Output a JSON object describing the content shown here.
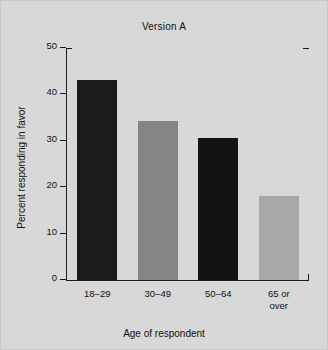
{
  "figure": {
    "background_color": "#d8d8d8",
    "axis_color": "#1c1c1c",
    "text_color": "#111111"
  },
  "chart_data": {
    "type": "bar",
    "title": "Version A",
    "xlabel": "Age of respondent",
    "ylabel": "Percent responding in favor",
    "categories": [
      "18–29",
      "30–49",
      "50–64",
      "65 or\nover"
    ],
    "values": [
      43,
      34.3,
      30.5,
      18
    ],
    "bar_colors": [
      "#1a1a1a",
      "#858585",
      "#121212",
      "#a8a8a8"
    ],
    "ylim": [
      0,
      50
    ],
    "yticks": [
      0,
      10,
      20,
      30,
      40,
      50
    ],
    "ytick_labels": [
      "0",
      "10",
      "20",
      "30",
      "40",
      "50"
    ],
    "grid": false,
    "legend": null
  }
}
